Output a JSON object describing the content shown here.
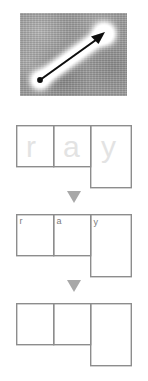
{
  "figure": {
    "panels": [
      {
        "id": "micrograph",
        "type": "image",
        "description": "grayscale noisy micrograph",
        "overlay": "black double-headed-style arrow with arrowhead at upper-right, dot at lower-left, surrounded by white glow halo",
        "colors": {
          "background": "#9c9c9c",
          "arrow": "#000000",
          "halo": "#f2f2f2"
        }
      },
      {
        "id": "grid-ghost",
        "type": "diagram",
        "letters": [
          "r",
          "a",
          "y"
        ],
        "letter_style": "large faint watermark",
        "letter_color": "#e3e3e3",
        "stroke_color": "#8d8d8d"
      },
      {
        "id": "grid-labeled",
        "type": "diagram",
        "letters": [
          "r",
          "a",
          "y"
        ],
        "letter_style": "small corner label",
        "letter_color": "#7b7b7b",
        "stroke_color": "#8d8d8d"
      },
      {
        "id": "grid-empty",
        "type": "diagram",
        "letters": [
          "",
          "",
          ""
        ],
        "letter_style": "none",
        "letter_color": "#ffffff",
        "stroke_color": "#8d8d8d"
      }
    ],
    "separators": [
      {
        "id": "arrow-1",
        "glyph": "▼",
        "color": "#a8a8a8"
      },
      {
        "id": "arrow-2",
        "glyph": "▼",
        "color": "#a8a8a8"
      }
    ],
    "cells": {
      "cell_1_label": "r",
      "cell_2_label": "a",
      "cell_3_label": "y"
    }
  }
}
